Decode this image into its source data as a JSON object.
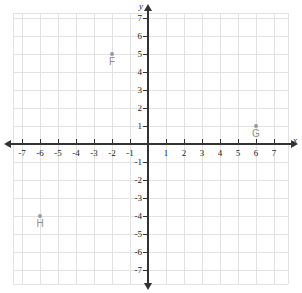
{
  "figure": {
    "axis_x_label": "x",
    "axis_y_label": "y",
    "grid_color": "#e2e2e2",
    "axis_color": "#333333",
    "point_color": "#9a9a9a",
    "label_color": "#8f8f8f",
    "background": "#ffffff"
  },
  "chart_data": {
    "type": "scatter",
    "title": "",
    "xlabel": "x",
    "ylabel": "y",
    "xlim": [
      -7.5,
      7.8
    ],
    "ylim": [
      -7.8,
      7.8
    ],
    "grid": true,
    "legend": "none",
    "x_ticks": [
      -7,
      -6,
      -5,
      -4,
      -3,
      -2,
      -1,
      1,
      2,
      3,
      4,
      5,
      6,
      7
    ],
    "y_ticks": [
      -7,
      -6,
      -5,
      -4,
      -3,
      -2,
      -1,
      1,
      2,
      3,
      4,
      5,
      6,
      7
    ],
    "x_tick_labels": [
      "-7",
      "-6",
      "-5",
      "-4",
      "-3",
      "-2",
      "-1",
      "1",
      "2",
      "3",
      "4",
      "5",
      "6",
      "7"
    ],
    "y_tick_labels": [
      "-7",
      "-6",
      "-5",
      "-4",
      "-3",
      "-2",
      "-1",
      "1",
      "2",
      "3",
      "4",
      "5",
      "6",
      "7"
    ],
    "points": [
      {
        "label": "F",
        "x": -2,
        "y": 5
      },
      {
        "label": "G",
        "x": 6,
        "y": 1
      },
      {
        "label": "H",
        "x": -6,
        "y": -4
      }
    ]
  }
}
